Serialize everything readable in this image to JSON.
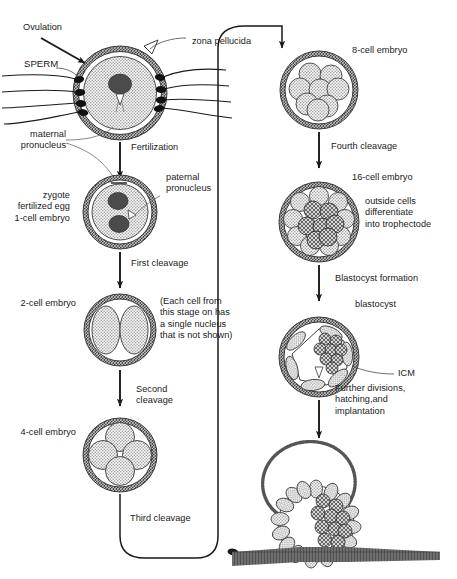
{
  "figure": {
    "colors": {
      "ink": "#1a1a1a",
      "stipple_light": "#c9c9c9",
      "stipple_mid": "#9a9a9a",
      "stipple_dark": "#5a5a5a",
      "nucleus": "#4a4a4a",
      "uterine_wall": "#555555",
      "background": "#ffffff"
    }
  },
  "left_column": {
    "ovulation_label": "Ovulation",
    "sperm_label": "SPERM",
    "zona_pellucida_label": "zona pellucida",
    "maternal_pronucleus_label": "maternal\npronucleus",
    "fertilization_label": "Fertilization",
    "paternal_pronucleus_label": "paternal\npronucleus",
    "zygote_label": "zygote\nfertilized egg\n1-cell embryo",
    "first_cleavage_label": "First cleavage",
    "two_cell_label": "2-cell embryo",
    "note_label": "(Each cell from\nthis stage on has\na single nucleus\nthat is not shown)",
    "second_cleavage_label": "Second\ncleavage",
    "four_cell_label": "4-cell embryo",
    "third_cleavage_label": "Third cleavage"
  },
  "right_column": {
    "eight_cell_label": "8-cell embryo",
    "fourth_cleavage_label": "Fourth cleavage",
    "sixteen_cell_label": "16-cell embryo",
    "trophectoderm_note": "outside cells\ndifferentiate\ninto trophectode",
    "blastocyst_formation_label": "Blastocyst formation",
    "blastocyst_label": "blastocyst",
    "icm_label": "ICM",
    "further_divisions_label": "Further divisions,\nhatching,and\nimplantation"
  },
  "stages": [
    {
      "id": "ovulated-egg",
      "name": "ovulated egg",
      "cells": 1,
      "has_zona": true,
      "nuclei": 1
    },
    {
      "id": "zygote",
      "name": "zygote / 1-cell embryo",
      "cells": 1,
      "has_zona": true,
      "nuclei": 2
    },
    {
      "id": "two-cell",
      "name": "2-cell embryo",
      "cells": 2,
      "has_zona": true,
      "nuclei": 0
    },
    {
      "id": "four-cell",
      "name": "4-cell embryo",
      "cells": 4,
      "has_zona": true,
      "nuclei": 0
    },
    {
      "id": "eight-cell",
      "name": "8-cell embryo",
      "cells": 8,
      "has_zona": true,
      "nuclei": 0
    },
    {
      "id": "sixteen-cell",
      "name": "16-cell embryo",
      "cells": 16,
      "has_zona": true,
      "nuclei": 0
    },
    {
      "id": "blastocyst",
      "name": "blastocyst",
      "cells": 32,
      "has_zona": true,
      "nuclei": 0
    },
    {
      "id": "implanting",
      "name": "hatching and implanting blastocyst",
      "cells": 32,
      "has_zona": true,
      "nuclei": 0
    }
  ],
  "sperm_count": 7
}
